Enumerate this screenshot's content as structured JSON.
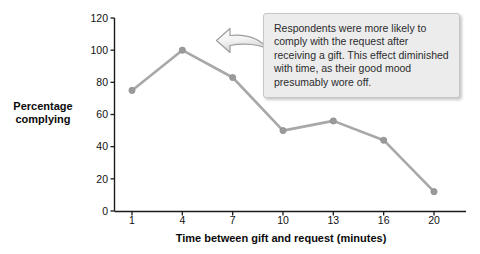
{
  "chart_data": {
    "type": "line",
    "title": "",
    "xlabel": "Time between gift and request (minutes)",
    "ylabel": "Percentage complying",
    "categories": [
      "1",
      "4",
      "7",
      "10",
      "13",
      "16",
      "20"
    ],
    "x": [
      1,
      4,
      7,
      10,
      13,
      16,
      20
    ],
    "values": [
      75,
      100,
      83,
      50,
      56,
      44,
      12
    ],
    "series": [
      {
        "name": "Percentage complying",
        "values": [
          75,
          100,
          83,
          50,
          56,
          44,
          12
        ]
      }
    ],
    "ylim": [
      0,
      120
    ],
    "yticks": [
      0,
      20,
      40,
      60,
      80,
      100,
      120
    ],
    "ytick_labels": [
      "0",
      "20",
      "40",
      "60",
      "80",
      "100",
      "120"
    ],
    "xtick_labels": [
      "1",
      "4",
      "7",
      "10",
      "13",
      "16",
      "20"
    ],
    "grid": false,
    "legend": "none",
    "line_color": "#a8a8a8",
    "marker_color": "#9a9a9a",
    "axis_color": "#1a1a1a",
    "background_color": "#ffffff"
  },
  "annotation": {
    "text": "Respondents were more likely to comply with the request after receiving a gift. This effect diminished with time, as their good mood presumably wore off.",
    "arrow_direction": "left",
    "box_color": "#ececed",
    "border_color": "#c6c6c8"
  }
}
